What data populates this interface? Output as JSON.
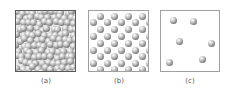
{
  "panels": [
    {
      "id": "a",
      "label": "(a)",
      "description": "densely packed, disordered particles",
      "box": {
        "x": 15,
        "y": 10,
        "w": 61,
        "h": 62
      },
      "sphere_diameter": 7,
      "generated": true,
      "count": 110
    },
    {
      "id": "b",
      "label": "(b)",
      "description": "ordered lattice of particles",
      "box": {
        "x": 88,
        "y": 10,
        "w": 61,
        "h": 62
      },
      "spheres": [
        [
          99,
          15
        ],
        [
          113,
          15
        ],
        [
          127,
          15
        ],
        [
          141,
          15
        ],
        [
          92,
          21
        ],
        [
          106,
          21
        ],
        [
          120,
          21
        ],
        [
          134,
          21
        ],
        [
          148,
          21
        ],
        [
          99,
          28
        ],
        [
          113,
          28
        ],
        [
          127,
          28
        ],
        [
          141,
          28
        ],
        [
          92,
          35
        ],
        [
          106,
          35
        ],
        [
          120,
          35
        ],
        [
          134,
          35
        ],
        [
          148,
          35
        ],
        [
          99,
          42
        ],
        [
          113,
          42
        ],
        [
          127,
          42
        ],
        [
          141,
          42
        ],
        [
          92,
          49
        ],
        [
          106,
          49
        ],
        [
          120,
          49
        ],
        [
          134,
          49
        ],
        [
          148,
          49
        ],
        [
          99,
          55
        ],
        [
          113,
          55
        ],
        [
          127,
          55
        ],
        [
          141,
          55
        ],
        [
          92,
          62
        ],
        [
          106,
          62
        ],
        [
          120,
          62
        ],
        [
          134,
          62
        ],
        [
          148,
          62
        ],
        [
          99,
          68
        ],
        [
          113,
          68
        ],
        [
          127,
          68
        ],
        [
          141,
          68
        ]
      ]
    },
    {
      "id": "c",
      "label": "(c)",
      "description": "sparse, widely separated particles",
      "box": {
        "x": 160,
        "y": 10,
        "w": 60,
        "h": 62
      },
      "spheres": [
        [
          172,
          19
        ],
        [
          192,
          20
        ],
        [
          178,
          40
        ],
        [
          210,
          42
        ],
        [
          168,
          61
        ],
        [
          201,
          58
        ]
      ]
    }
  ],
  "colors": {
    "dense_border": "#5a5a5a",
    "light_border": "#a0a0a0",
    "label": "#555555"
  }
}
